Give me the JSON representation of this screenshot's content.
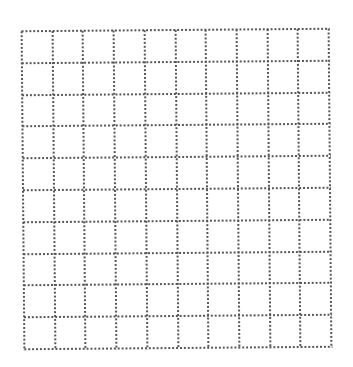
{
  "grid": {
    "columns": 10,
    "rows": 10,
    "line_style": "dotted",
    "line_color": "#555555",
    "background": "#ffffff"
  }
}
